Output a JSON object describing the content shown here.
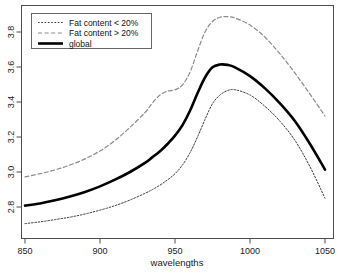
{
  "chart_data": {
    "type": "line",
    "title": "",
    "xlabel": "wavelengths",
    "ylabel": "",
    "xlim": [
      850,
      1050
    ],
    "ylim": [
      2.66,
      3.93
    ],
    "grid": false,
    "legend_position": "top-left",
    "xticks": [
      850,
      900,
      950,
      1000,
      1050
    ],
    "xtick_labels": [
      "850",
      "900",
      "950",
      "1000",
      "1050"
    ],
    "yticks": [
      2.8,
      3.0,
      3.2,
      3.4,
      3.6,
      3.8
    ],
    "ytick_labels": [
      "2.8",
      "3.0",
      "3.2",
      "3.4",
      "3.6",
      "3.8"
    ],
    "x": [
      850,
      860,
      870,
      880,
      890,
      900,
      910,
      920,
      930,
      935,
      940,
      945,
      950,
      955,
      960,
      965,
      970,
      975,
      980,
      985,
      990,
      1000,
      1010,
      1020,
      1030,
      1040,
      1050
    ],
    "series": [
      {
        "name": "Fat content < 20%",
        "style": "dotted",
        "color": "#3a3a3a",
        "width": 1,
        "values": [
          2.705,
          2.715,
          2.728,
          2.742,
          2.76,
          2.782,
          2.808,
          2.84,
          2.878,
          2.9,
          2.925,
          2.955,
          2.99,
          3.04,
          3.11,
          3.2,
          3.3,
          3.39,
          3.44,
          3.465,
          3.47,
          3.44,
          3.375,
          3.29,
          3.18,
          3.03,
          2.85
        ]
      },
      {
        "name": "Fat content > 20%",
        "style": "dashed",
        "color": "#8a8a8a",
        "width": 1.2,
        "values": [
          2.972,
          2.99,
          3.012,
          3.04,
          3.075,
          3.12,
          3.18,
          3.255,
          3.34,
          3.395,
          3.44,
          3.462,
          3.47,
          3.498,
          3.57,
          3.69,
          3.8,
          3.86,
          3.884,
          3.888,
          3.88,
          3.84,
          3.77,
          3.675,
          3.565,
          3.445,
          3.32
        ]
      },
      {
        "name": "global",
        "style": "solid",
        "color": "#000000",
        "width": 2.6,
        "values": [
          2.808,
          2.82,
          2.838,
          2.86,
          2.886,
          2.918,
          2.956,
          3.0,
          3.052,
          3.085,
          3.118,
          3.16,
          3.208,
          3.268,
          3.35,
          3.45,
          3.54,
          3.598,
          3.614,
          3.612,
          3.598,
          3.548,
          3.478,
          3.392,
          3.29,
          3.16,
          3.014
        ]
      }
    ]
  },
  "legend": {
    "entries": [
      {
        "label": "Fat content < 20%",
        "style": "dotted"
      },
      {
        "label": "Fat content > 20%",
        "style": "dashed"
      },
      {
        "label": "global",
        "style": "solid"
      }
    ]
  },
  "axes": {
    "x_title": "wavelengths"
  }
}
